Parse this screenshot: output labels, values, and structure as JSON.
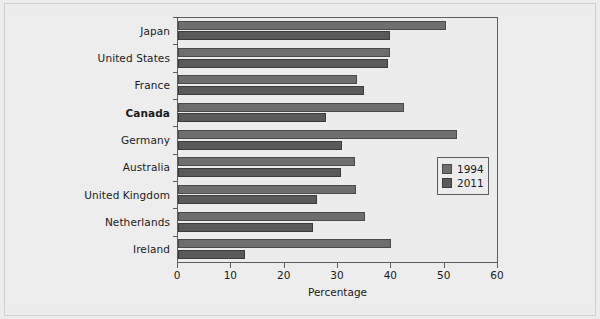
{
  "chart_data": {
    "type": "bar",
    "orientation": "horizontal",
    "title": "",
    "xlabel": "Percentage",
    "ylabel": "",
    "xlim": [
      0,
      60
    ],
    "xticks": [
      0,
      10,
      20,
      30,
      40,
      50,
      60
    ],
    "xtick_labels": [
      "0",
      "10",
      "20",
      "30",
      "40",
      "50",
      "60"
    ],
    "grid": false,
    "legend_position": "middle-right",
    "highlighted_category": "Canada",
    "categories": [
      "Japan",
      "United States",
      "France",
      "Canada",
      "Germany",
      "Australia",
      "United Kingdom",
      "Netherlands",
      "Ireland"
    ],
    "series": [
      {
        "name": "1994",
        "color": "#6e6e6e",
        "values": [
          50.3,
          39.8,
          33.5,
          42.4,
          52.3,
          33.1,
          33.3,
          35.1,
          40.0
        ]
      },
      {
        "name": "2011",
        "color": "#5a5a5a",
        "values": [
          39.8,
          39.3,
          34.8,
          27.7,
          30.7,
          30.5,
          26.0,
          25.4,
          12.5
        ]
      }
    ]
  },
  "legend": {
    "items": [
      {
        "label": "1994"
      },
      {
        "label": "2011"
      }
    ]
  },
  "axis": {
    "x_title": "Percentage"
  }
}
